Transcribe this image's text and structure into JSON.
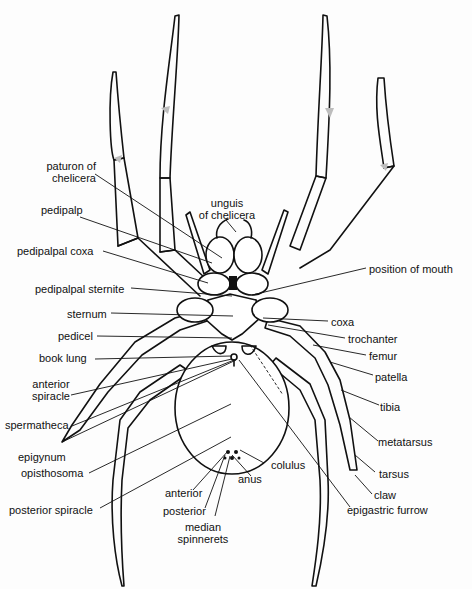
{
  "figure": {
    "labels": [
      {
        "id": "paturon-of-chelicera",
        "text": "paturon of\nchelicera",
        "x": 40,
        "y": 160,
        "align": "right",
        "w": 56
      },
      {
        "id": "unguis-of-chelicera",
        "text": "unguis\nof chelicera",
        "x": 192,
        "y": 197,
        "align": "center",
        "w": 70
      },
      {
        "id": "pedipalp",
        "text": "pedipalp",
        "x": 41,
        "y": 204,
        "align": "left",
        "w": 60
      },
      {
        "id": "pedipalpal-coxa",
        "text": "pedipalpal coxa",
        "x": 17,
        "y": 245,
        "align": "left",
        "w": 90
      },
      {
        "id": "position-of-mouth",
        "text": "position of mouth",
        "x": 369,
        "y": 263,
        "align": "left",
        "w": 100
      },
      {
        "id": "pedipalpal-sternite",
        "text": "pedipalpal sternite",
        "x": 35,
        "y": 283,
        "align": "left",
        "w": 100
      },
      {
        "id": "sternum",
        "text": "sternum",
        "x": 67,
        "y": 308,
        "align": "left",
        "w": 45
      },
      {
        "id": "coxa",
        "text": "coxa",
        "x": 331,
        "y": 316,
        "align": "left",
        "w": 30
      },
      {
        "id": "pedicel",
        "text": "pedicel",
        "x": 58,
        "y": 330,
        "align": "left",
        "w": 40
      },
      {
        "id": "trochanter",
        "text": "trochanter",
        "x": 348,
        "y": 333,
        "align": "left",
        "w": 60
      },
      {
        "id": "book-lung",
        "text": "book lung",
        "x": 39,
        "y": 352,
        "align": "left",
        "w": 55
      },
      {
        "id": "femur",
        "text": "femur",
        "x": 369,
        "y": 350,
        "align": "left",
        "w": 40
      },
      {
        "id": "anterior-spiracle",
        "text": "anterior\nspiracle",
        "x": 29,
        "y": 378,
        "align": "center",
        "w": 44
      },
      {
        "id": "patella",
        "text": "patella",
        "x": 375,
        "y": 371,
        "align": "left",
        "w": 45
      },
      {
        "id": "tibia",
        "text": "tibia",
        "x": 380,
        "y": 401,
        "align": "left",
        "w": 30
      },
      {
        "id": "spermatheca",
        "text": "spermatheca",
        "x": 5,
        "y": 419,
        "align": "left",
        "w": 66
      },
      {
        "id": "metatarsus",
        "text": "metatarsus",
        "x": 378,
        "y": 436,
        "align": "left",
        "w": 60
      },
      {
        "id": "epigynum",
        "text": "epigynum",
        "x": 18,
        "y": 451,
        "align": "left",
        "w": 55
      },
      {
        "id": "colulus",
        "text": "colulus",
        "x": 271,
        "y": 459,
        "align": "left",
        "w": 45
      },
      {
        "id": "opisthosoma",
        "text": "opisthosoma",
        "x": 21,
        "y": 467,
        "align": "left",
        "w": 66
      },
      {
        "id": "tarsus",
        "text": "tarsus",
        "x": 379,
        "y": 468,
        "align": "left",
        "w": 40
      },
      {
        "id": "anus",
        "text": "anus",
        "x": 238,
        "y": 473,
        "align": "left",
        "w": 30
      },
      {
        "id": "anterior",
        "text": "anterior",
        "x": 165,
        "y": 487,
        "align": "left",
        "w": 45
      },
      {
        "id": "claw",
        "text": "claw",
        "x": 374,
        "y": 489,
        "align": "left",
        "w": 30
      },
      {
        "id": "posterior-spiracle",
        "text": "posterior spiracle",
        "x": 9,
        "y": 504,
        "align": "left",
        "w": 95
      },
      {
        "id": "epigastric-furrow",
        "text": "epigastric furrow",
        "x": 347,
        "y": 504,
        "align": "left",
        "w": 95
      },
      {
        "id": "posterior",
        "text": "posterior",
        "x": 163,
        "y": 505,
        "align": "left",
        "w": 50
      },
      {
        "id": "median-spinnerets",
        "text": "median\nspinnerets",
        "x": 168,
        "y": 521,
        "align": "center",
        "w": 70
      }
    ],
    "leaders": [
      [
        95,
        174,
        222,
        258
      ],
      [
        226,
        220,
        236,
        232
      ],
      [
        80,
        217,
        212,
        263
      ],
      [
        103,
        251,
        208,
        283
      ],
      [
        366,
        268,
        252,
        295
      ],
      [
        131,
        288,
        232,
        296
      ],
      [
        111,
        313,
        233,
        316
      ],
      [
        328,
        321,
        263,
        318
      ],
      [
        97,
        336,
        232,
        338
      ],
      [
        345,
        338,
        268,
        325
      ],
      [
        95,
        359,
        232,
        356
      ],
      [
        366,
        355,
        313,
        345
      ],
      [
        71,
        395,
        232,
        359
      ],
      [
        373,
        375,
        330,
        362
      ],
      [
        72,
        426,
        234,
        360
      ],
      [
        379,
        405,
        341,
        390
      ],
      [
        378,
        441,
        349,
        417
      ],
      [
        62,
        442,
        236,
        360
      ],
      [
        375,
        472,
        355,
        455
      ],
      [
        89,
        473,
        231,
        404
      ],
      [
        264,
        463,
        240,
        450
      ],
      [
        372,
        494,
        355,
        475
      ],
      [
        251,
        476,
        232,
        455
      ],
      [
        193,
        490,
        228,
        451
      ],
      [
        100,
        508,
        231,
        437
      ],
      [
        205,
        508,
        225,
        455
      ],
      [
        215,
        516,
        230,
        456
      ],
      [
        350,
        507,
        239,
        360
      ]
    ]
  }
}
